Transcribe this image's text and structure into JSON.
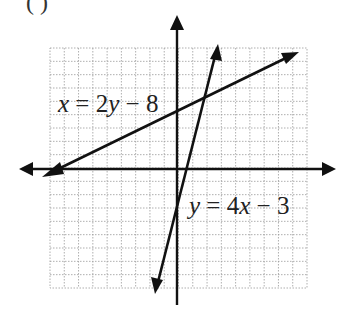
{
  "top_fragment": {
    "text": "(      )"
  },
  "graph": {
    "grid": {
      "x_min": -9,
      "x_max": 9,
      "y_min": -9,
      "y_max": 9,
      "line_color": "#9a9a9a",
      "style": "dotted"
    },
    "axes": {
      "color": "#111111",
      "x_axis_arrows": "both",
      "y_axis_arrows": "up"
    },
    "lines": [
      {
        "equation": "x = 2y − 8",
        "parts": [
          "x",
          " = 2",
          "y",
          " − 8"
        ],
        "slope_label": "shallow",
        "color": "#111111"
      },
      {
        "equation": "y = 4x − 3",
        "parts": [
          "y",
          " = 4",
          "x",
          " − 3"
        ],
        "slope_label": "steep",
        "color": "#111111"
      }
    ]
  }
}
